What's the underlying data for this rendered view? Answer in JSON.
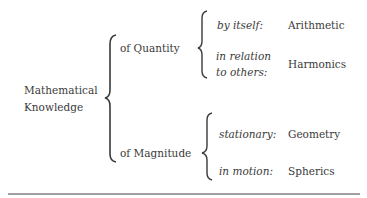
{
  "root": {
    "line1": "Mathematical",
    "line2": "Knowledge"
  },
  "branches": [
    {
      "label": "of Quantity",
      "children": [
        {
          "condition": "by itself:",
          "subject": "Arithmetic"
        },
        {
          "condition_line1": "in relation",
          "condition_line2": "to others:",
          "subject": "Harmonics"
        }
      ]
    },
    {
      "label": "of Magnitude",
      "children": [
        {
          "condition": "stationary:",
          "subject": "Geometry"
        },
        {
          "condition": "in motion:",
          "subject": "Spherics"
        }
      ]
    }
  ]
}
